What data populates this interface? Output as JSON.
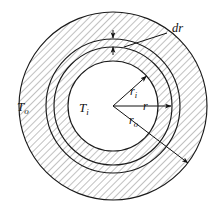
{
  "figure": {
    "type": "cross-section-diagram",
    "background_color": "#ffffff",
    "line_color": "#1a1a1a",
    "hatch_color": "#6e6e6e",
    "hatch_angle_deg": 45,
    "center": {
      "x": 113,
      "y": 106
    }
  },
  "circles": [
    {
      "name": "outer-circle",
      "radius": 94,
      "label_ref": "r_o"
    },
    {
      "name": "dr-outer-circle",
      "radius": 67,
      "label_ref": "dr"
    },
    {
      "name": "dr-inner-circle",
      "radius": 59,
      "label_ref": "r"
    },
    {
      "name": "inner-bore-circle",
      "radius": 45,
      "label_ref": "r_i"
    }
  ],
  "regions": [
    {
      "name": "outer-annulus",
      "hatched": true
    },
    {
      "name": "dr-band",
      "hatched": true
    },
    {
      "name": "inner-annulus",
      "hatched": true
    },
    {
      "name": "bore",
      "hatched": false
    }
  ],
  "labels": {
    "outer_temperature": "T",
    "outer_temperature_sub": "o",
    "inner_temperature": "T",
    "inner_temperature_sub": "i",
    "inner_radius": "r",
    "inner_radius_sub": "i",
    "radius": "r",
    "outer_radius": "r",
    "outer_radius_sub": "o",
    "thickness": "dr"
  },
  "annotations": [
    {
      "name": "dr-leader",
      "text": "dr",
      "points_to": "dr-band"
    },
    {
      "name": "dr-arrow-upper",
      "direction": "down"
    },
    {
      "name": "dr-arrow-lower",
      "direction": "up"
    },
    {
      "name": "inner-radius-arrow",
      "from": "center",
      "to": "inner-bore-circle"
    },
    {
      "name": "radius-arrow",
      "from": "center",
      "to": "dr-inner-circle"
    },
    {
      "name": "outer-radius-arrow",
      "from": "center",
      "to": "outer-circle"
    }
  ]
}
